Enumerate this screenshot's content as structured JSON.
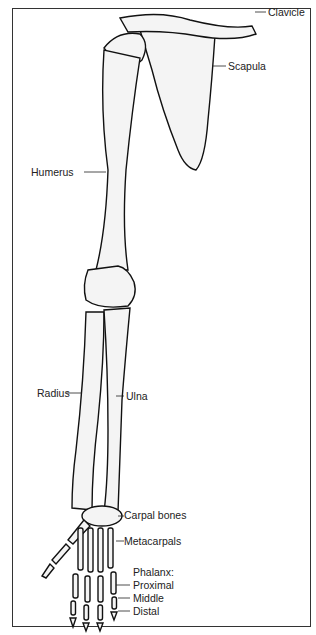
{
  "figure": {
    "labels": {
      "clavicle": "Clavicle",
      "scapula": "Scapula",
      "humerus": "Humerus",
      "radius": "Radius",
      "ulna": "Ulna",
      "carpal": "Carpal bones",
      "metacarpals": "Metacarpals",
      "phalanx": "Phalanx:",
      "proximal": "Proximal",
      "middle": "Middle",
      "distal": "Distal"
    }
  }
}
